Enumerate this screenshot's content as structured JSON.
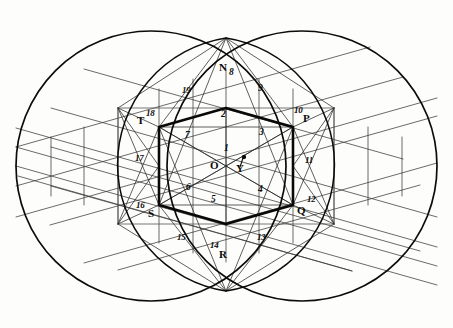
{
  "figure": {
    "canvas": {
      "width": 453,
      "height": 328
    },
    "colors": {
      "ink": "#0b0b0b",
      "light_line": "#3c3c3c",
      "paper": "#fdfdfb"
    },
    "circles": [
      {
        "name": "left-circle",
        "cx": 151,
        "cy": 166,
        "r": 135
      },
      {
        "name": "right-circle",
        "cx": 302,
        "cy": 166,
        "r": 135
      }
    ],
    "vesica_nodes": [
      {
        "name": "top-intersection",
        "x": 226,
        "y": 38
      },
      {
        "name": "bottom-intersection",
        "x": 226,
        "y": 291
      }
    ],
    "hexagon": {
      "center": {
        "x": 226,
        "y": 166
      },
      "vertices": [
        {
          "label": "N",
          "x": 226,
          "y": 108
        },
        {
          "label": "P",
          "x": 293,
          "y": 127
        },
        {
          "label": "Q",
          "x": 293,
          "y": 205
        },
        {
          "label": "R",
          "x": 226,
          "y": 224
        },
        {
          "label": "S",
          "x": 159,
          "y": 205
        },
        {
          "label": "T",
          "x": 159,
          "y": 127
        }
      ]
    },
    "bounding_rect": {
      "x": 118,
      "y": 108,
      "width": 216,
      "height": 116
    },
    "point_labels": [
      {
        "text": "N",
        "x": 219,
        "y": 68,
        "name": "point-label-N"
      },
      {
        "text": "O",
        "x": 212,
        "y": 160,
        "name": "point-label-O"
      },
      {
        "text": "P",
        "x": 303,
        "y": 117,
        "name": "point-label-P"
      },
      {
        "text": "Q",
        "x": 298,
        "y": 207,
        "name": "point-label-Q"
      },
      {
        "text": "R",
        "x": 220,
        "y": 252,
        "name": "point-label-R"
      },
      {
        "text": "S",
        "x": 149,
        "y": 210,
        "name": "point-label-S"
      },
      {
        "text": "T",
        "x": 139,
        "y": 117,
        "name": "point-label-T"
      },
      {
        "text": "Y",
        "x": 238,
        "y": 163,
        "name": "point-label-Y"
      }
    ],
    "number_labels": [
      {
        "text": "1",
        "x": 224,
        "y": 149,
        "name": "region-label-1"
      },
      {
        "text": "2",
        "x": 222,
        "y": 114,
        "name": "region-label-2"
      },
      {
        "text": "3",
        "x": 260,
        "y": 132,
        "name": "region-label-3"
      },
      {
        "text": "4",
        "x": 259,
        "y": 189,
        "name": "region-label-4"
      },
      {
        "text": "5",
        "x": 212,
        "y": 199,
        "name": "region-label-5"
      },
      {
        "text": "6",
        "x": 187,
        "y": 187,
        "name": "region-label-6"
      },
      {
        "text": "7",
        "x": 186,
        "y": 135,
        "name": "region-label-7"
      },
      {
        "text": "8",
        "x": 230,
        "y": 72,
        "name": "region-label-8"
      },
      {
        "text": "9",
        "x": 259,
        "y": 88,
        "name": "region-label-9"
      },
      {
        "text": "10",
        "x": 295,
        "y": 110,
        "name": "region-label-10"
      },
      {
        "text": "11",
        "x": 305,
        "y": 160,
        "name": "region-label-11"
      },
      {
        "text": "12",
        "x": 308,
        "y": 199,
        "name": "region-label-12"
      },
      {
        "text": "13",
        "x": 258,
        "y": 237,
        "name": "region-label-13"
      },
      {
        "text": "14",
        "x": 211,
        "y": 245,
        "name": "region-label-14"
      },
      {
        "text": "15",
        "x": 178,
        "y": 237,
        "name": "region-label-15"
      },
      {
        "text": "16",
        "x": 137,
        "y": 205,
        "name": "region-label-16"
      },
      {
        "text": "17",
        "x": 136,
        "y": 158,
        "name": "region-label-17"
      },
      {
        "text": "18",
        "x": 147,
        "y": 113,
        "name": "region-label-18"
      },
      {
        "text": "19",
        "x": 183,
        "y": 90,
        "name": "region-label-19"
      }
    ]
  }
}
